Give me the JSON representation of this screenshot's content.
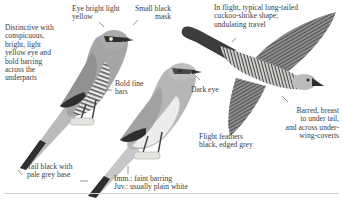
{
  "plate": {
    "subject": "cuckoo-shrike field guide illustration",
    "colors": {
      "ink": "#3c3c3c",
      "plumage_grey": "#9a9c9e",
      "dark": "#2e2e30",
      "pale": "#e6e6e3",
      "rule": "#cfcfcf"
    }
  },
  "figures": [
    {
      "name": "adult-perched",
      "description": "Perched adult with barred underparts"
    },
    {
      "name": "immature-perched",
      "description": "Perched immature/juvenile, plain underparts"
    },
    {
      "name": "in-flight",
      "description": "Bird in flight from below"
    }
  ],
  "labels": {
    "distinctive": [
      "Distinctive with",
      "conspicuous,",
      "bright, light",
      "yellow eye and",
      "bold barring",
      "across the",
      "underparts"
    ],
    "eye": [
      "Eye bright light",
      "yellow"
    ],
    "mask": [
      "Small black",
      "mask"
    ],
    "flight_shape": [
      "In flight, typical long-tailed",
      "cuckoo-shrike shape;",
      "undulating travel"
    ],
    "bold_bars": [
      "Bold fine",
      "bars"
    ],
    "dark_eye": [
      "Dark eye"
    ],
    "barred_breast": [
      "Barred, breast",
      "to under tail,",
      "and across under-",
      "wing-coverts"
    ],
    "flight_feathers": [
      "Flight feathers",
      "black, edged grey"
    ],
    "tail": [
      "Tail black with",
      "pale grey base"
    ],
    "immature": [
      "Imm.: faint barring",
      "Juv.: usually plain white"
    ]
  }
}
